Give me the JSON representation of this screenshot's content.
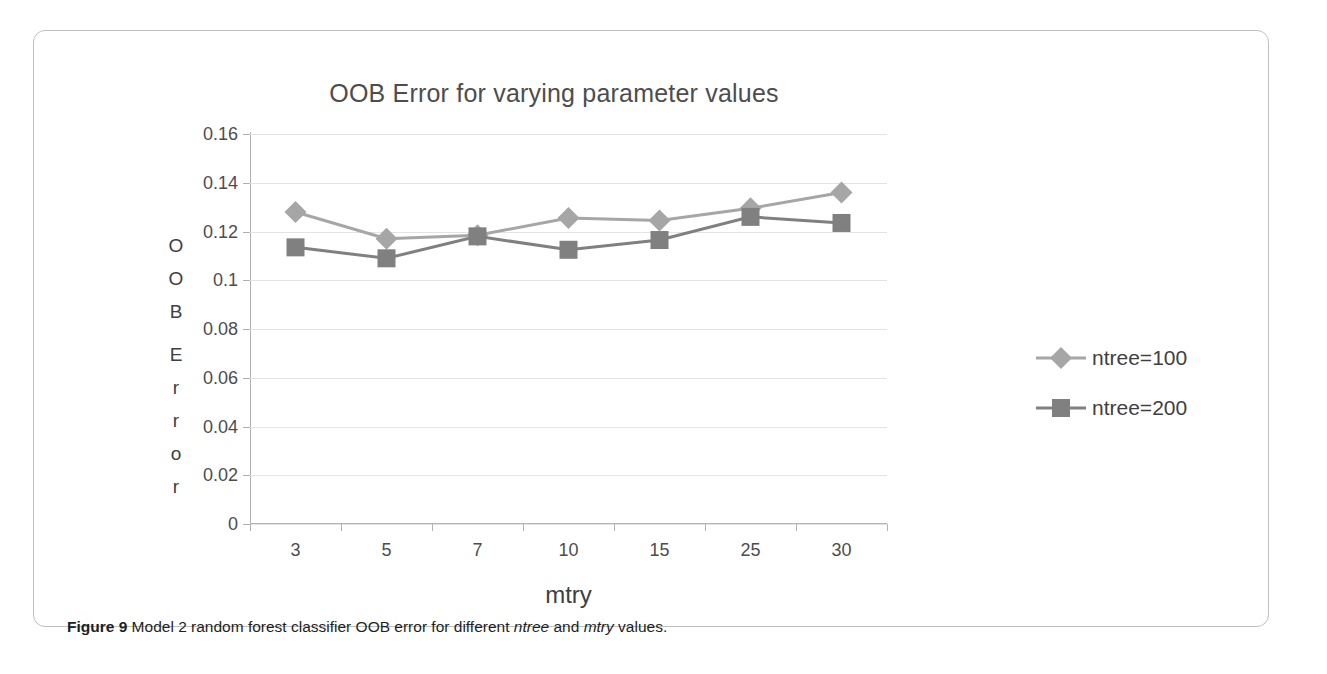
{
  "figure": {
    "caption_label": "Figure 9",
    "caption_text_1": " Model 2 random forest classifier OOB error for different ",
    "caption_em_1": "ntree",
    "caption_text_2": " and ",
    "caption_em_2": "mtry",
    "caption_text_3": " values."
  },
  "y_axis_title_chars": [
    "O",
    "O",
    "B",
    "",
    "E",
    "r",
    "r",
    "o",
    "r"
  ],
  "colors": {
    "series_1": "#a6a6a6",
    "series_2": "#808080",
    "gridline": "#e3e3e3",
    "axis": "#b3b3b3",
    "title_text": "#4d4d4d",
    "frame": "#bfbfbf",
    "caption_text": "#231f20"
  },
  "chart_data": {
    "type": "line",
    "title": "OOB Error for varying parameter values",
    "xlabel": "mtry",
    "ylabel": "OOB Error",
    "categories": [
      "3",
      "5",
      "7",
      "10",
      "15",
      "25",
      "30"
    ],
    "ylim": [
      0,
      0.16
    ],
    "yticks": [
      0,
      0.02,
      0.04,
      0.06,
      0.08,
      0.1,
      0.12,
      0.14,
      0.16
    ],
    "ytick_labels": [
      "0",
      "0.02",
      "0.04",
      "0.06",
      "0.08",
      "0.1",
      "0.12",
      "0.14",
      "0.16"
    ],
    "grid": true,
    "legend_position": "right",
    "series": [
      {
        "name": "ntree=100",
        "marker": "diamond",
        "color": "#a6a6a6",
        "values": [
          0.128,
          0.117,
          0.1185,
          0.1255,
          0.1245,
          0.1295,
          0.136
        ]
      },
      {
        "name": "ntree=200",
        "marker": "square",
        "color": "#808080",
        "values": [
          0.1135,
          0.109,
          0.118,
          0.1125,
          0.1165,
          0.126,
          0.1235
        ]
      }
    ]
  }
}
